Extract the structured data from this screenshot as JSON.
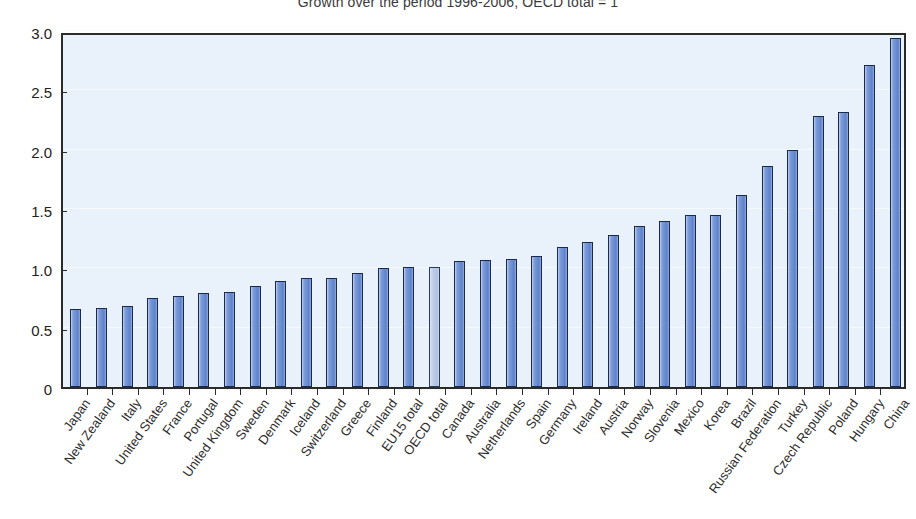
{
  "chart_data": {
    "type": "bar",
    "title": "Growth over the period 1996-2006, OECD total = 1",
    "xlabel": "",
    "ylabel": "",
    "ylim": [
      0,
      3.0
    ],
    "ytick_labels": [
      "0",
      "0.5",
      "1.0",
      "1.5",
      "2.0",
      "2.5",
      "3.0"
    ],
    "ytick_values": [
      0,
      0.5,
      1.0,
      1.5,
      2.0,
      2.5,
      3.0
    ],
    "grid": true,
    "legend": null,
    "highlight_category": "OECD total",
    "categories": [
      "Japan",
      "New Zealand",
      "Italy",
      "United States",
      "France",
      "Portugal",
      "United Kingdom",
      "Sweden",
      "Denmark",
      "Iceland",
      "Switzerland",
      "Greece",
      "Finland",
      "EU15 total",
      "OECD total",
      "Canada",
      "Australia",
      "Netherlands",
      "Spain",
      "Germany",
      "Ireland",
      "Austria",
      "Norway",
      "Slovenia",
      "Mexico",
      "Korea",
      "Brazil",
      "Russian Federation",
      "Turkey",
      "Czech Republic",
      "Poland",
      "Hungary",
      "China"
    ],
    "values": [
      0.66,
      0.67,
      0.68,
      0.75,
      0.77,
      0.79,
      0.8,
      0.85,
      0.89,
      0.92,
      0.92,
      0.96,
      1.0,
      1.01,
      1.01,
      1.06,
      1.07,
      1.08,
      1.1,
      1.18,
      1.22,
      1.28,
      1.36,
      1.4,
      1.45,
      1.45,
      1.62,
      1.86,
      2.0,
      2.28,
      2.32,
      2.71,
      2.94
    ]
  },
  "colors": {
    "plot_background": "#e9f1fa",
    "bar_fill": "#6c8ed2",
    "bar_border": "#1b2a4a",
    "highlight_fill": "#b7c8e4",
    "axis": "#2b2b2b",
    "text": "#2d2d2d",
    "page_background": "#ffffff"
  }
}
